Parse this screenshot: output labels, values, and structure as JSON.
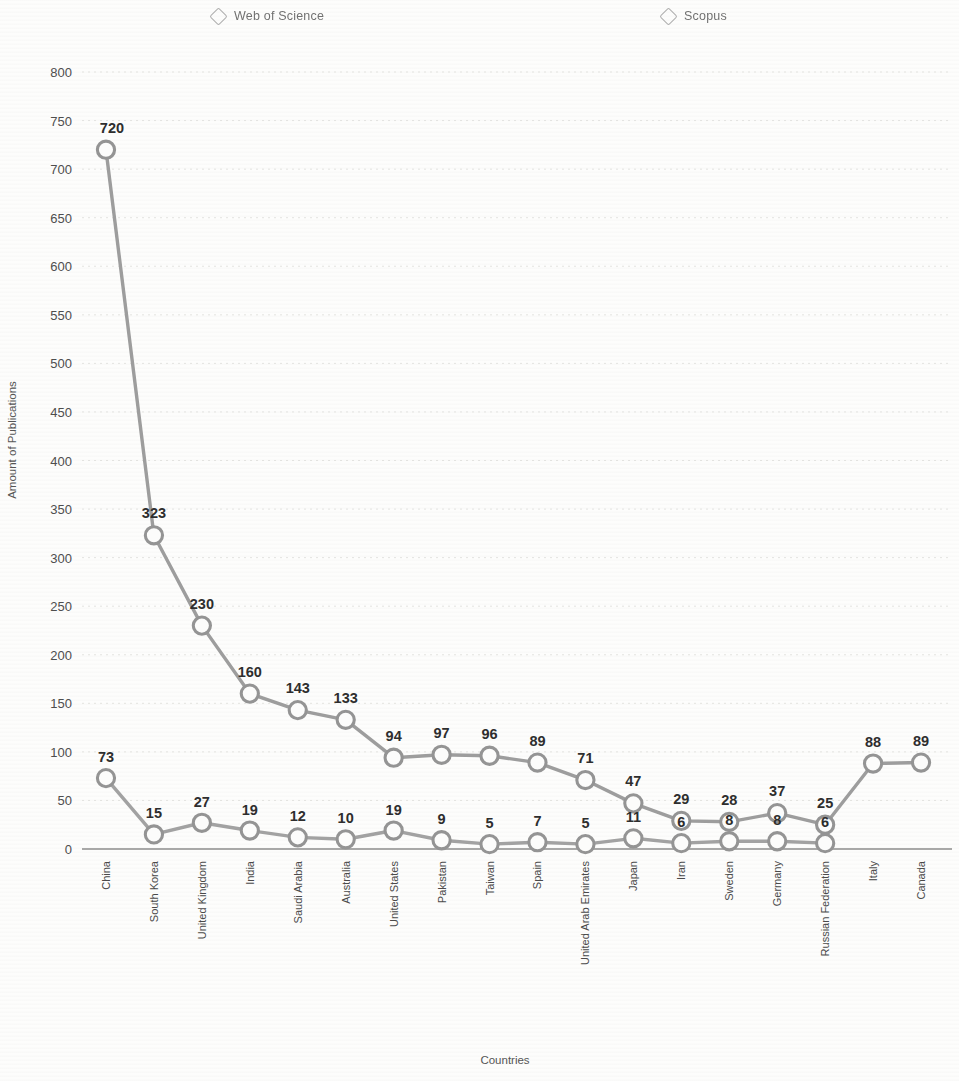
{
  "legend": {
    "items": [
      {
        "label": "Web of Science",
        "marker": "diamond-outline-icon"
      },
      {
        "label": "Scopus",
        "marker": "diamond-outline-icon"
      }
    ]
  },
  "axes": {
    "ylabel": "Amount of Publications",
    "xlabel": "Countries",
    "yticks": [
      "0",
      "50",
      "100",
      "150",
      "200",
      "250",
      "300",
      "350",
      "400",
      "450",
      "500",
      "550",
      "600",
      "650",
      "700",
      "750",
      "800"
    ]
  },
  "chart_data": {
    "type": "line",
    "title": "",
    "xlabel": "Countries",
    "ylabel": "Amount of Publications",
    "ylim": [
      0,
      800
    ],
    "ytick_step": 50,
    "grid": true,
    "legend_position": "top",
    "categories": [
      "China",
      "South Korea",
      "United Kingdom",
      "India",
      "Saudi Arabia",
      "Australia",
      "United States",
      "Pakistan",
      "Taiwan",
      "Spain",
      "United Arab Emirates",
      "Japan",
      "Iran",
      "Sweden",
      "Germany",
      "Russian Federation",
      "Italy",
      "Canada"
    ],
    "series": [
      {
        "name": "Scopus",
        "color": "#9d9d9d",
        "values": [
          720,
          323,
          230,
          160,
          143,
          133,
          94,
          97,
          96,
          89,
          71,
          47,
          29,
          28,
          37,
          25,
          88,
          89
        ]
      },
      {
        "name": "Web of Science",
        "color": "#a2a2a2",
        "values": [
          73,
          15,
          27,
          19,
          12,
          10,
          19,
          9,
          5,
          7,
          5,
          11,
          6,
          8,
          8,
          6,
          null,
          null
        ]
      }
    ],
    "data_labels_upper": [
      "720",
      "323",
      "230",
      "160",
      "143",
      "133",
      "94",
      "97",
      "96",
      "89",
      "71",
      "47",
      "29",
      "28",
      "37",
      "25",
      "88",
      "89"
    ],
    "data_labels_lower": [
      "73",
      "15",
      "27",
      "19",
      "12",
      "10",
      "19",
      "9",
      "5",
      "7",
      "5",
      "11",
      "6",
      "8",
      "8",
      "6",
      "",
      ""
    ]
  }
}
